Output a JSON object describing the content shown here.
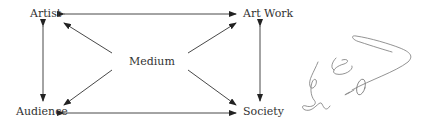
{
  "diagram": {
    "nodes": {
      "artist": "Artist",
      "artwork": "Art Work",
      "medium": "Medium",
      "audience": "Audience",
      "society": "Society"
    },
    "edges": [
      {
        "from": "artwork",
        "to": "artist",
        "type": "double-arrow"
      },
      {
        "from": "audience",
        "to": "society",
        "type": "double-arrow"
      },
      {
        "from": "artist",
        "to": "audience",
        "type": "double-arrow"
      },
      {
        "from": "artwork",
        "to": "society",
        "type": "double-arrow"
      },
      {
        "from": "medium",
        "to": "artist",
        "type": "arrow"
      },
      {
        "from": "medium",
        "to": "artwork",
        "type": "arrow"
      },
      {
        "from": "medium",
        "to": "audience",
        "type": "arrow"
      },
      {
        "from": "medium",
        "to": "society",
        "type": "arrow"
      }
    ],
    "signature": "handwritten-signature"
  }
}
